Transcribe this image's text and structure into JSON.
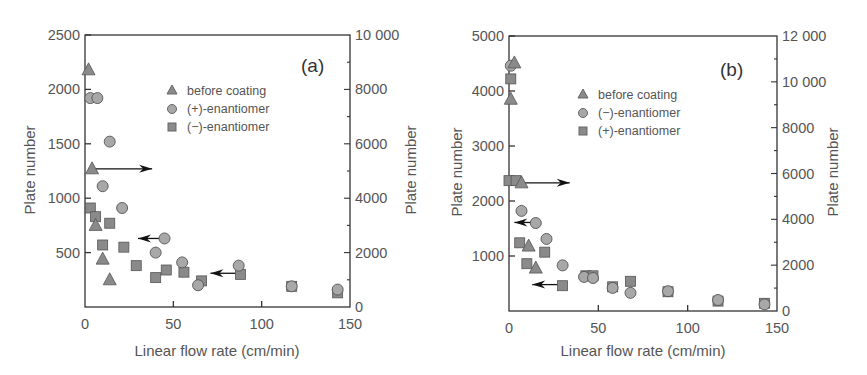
{
  "chart_data": [
    {
      "type": "scatter",
      "panel_label": "(a)",
      "title": "",
      "xlabel": "Linear flow rate (cm/min)",
      "ylabel": "Plate number",
      "ylabel_right": "Plate number",
      "xlim": [
        0,
        150
      ],
      "ylim": [
        0,
        2500
      ],
      "ylim_right": [
        0,
        10000
      ],
      "xticks": [
        0,
        50,
        100,
        150
      ],
      "yticks": [
        500,
        1000,
        1500,
        2000,
        2500
      ],
      "yticks_right": [
        0,
        2000,
        4000,
        6000,
        8000,
        10000
      ],
      "xtick_labels": [
        "0",
        "50",
        "100",
        "150"
      ],
      "ytick_labels": [
        "500",
        "1000",
        "1500",
        "2000",
        "2500"
      ],
      "ytick_right_labels": [
        "0",
        "2000",
        "4000",
        "6000",
        "8000",
        "10 000"
      ],
      "grid": false,
      "legend_position": "upper center",
      "series": [
        {
          "name": "before coating",
          "marker": "triangle",
          "axis": "right (arrow)",
          "x": [
            2,
            4,
            6,
            10,
            14
          ],
          "y": [
            2180,
            1270,
            750,
            440,
            250
          ]
        },
        {
          "name": "(+)-enantiomer",
          "marker": "circle",
          "axis": "left (arrow)",
          "x": [
            3,
            7,
            14,
            10,
            21,
            45,
            40,
            55,
            64,
            87,
            117,
            143
          ],
          "y": [
            1920,
            1920,
            1520,
            1110,
            910,
            630,
            500,
            410,
            200,
            380,
            190,
            160
          ]
        },
        {
          "name": "(−)-enantiomer",
          "marker": "square",
          "axis": "left (arrow)",
          "x": [
            3,
            6,
            14,
            10,
            22,
            29,
            40,
            46,
            56,
            66,
            88,
            117,
            143
          ],
          "y": [
            910,
            830,
            770,
            570,
            550,
            380,
            270,
            340,
            320,
            240,
            300,
            190,
            130
          ]
        }
      ],
      "annotations": [
        {
          "type": "arrow",
          "direction": "right",
          "from": [
            5,
            1270
          ],
          "to": [
            38,
            1270
          ]
        },
        {
          "type": "arrow",
          "direction": "left",
          "from": [
            44,
            630
          ],
          "to": [
            30,
            630
          ]
        },
        {
          "type": "arrow",
          "direction": "left",
          "from": [
            86,
            310
          ],
          "to": [
            71,
            310
          ]
        }
      ]
    },
    {
      "type": "scatter",
      "panel_label": "(b)",
      "title": "",
      "xlabel": "Linear flow rate (cm/min)",
      "ylabel": "Plate number",
      "ylabel_right": "Plate number",
      "xlim": [
        0,
        150
      ],
      "ylim": [
        0,
        5000
      ],
      "ylim_right": [
        0,
        12000
      ],
      "xticks": [
        0,
        50,
        100,
        150
      ],
      "yticks": [
        1000,
        2000,
        3000,
        4000,
        5000
      ],
      "yticks_right": [
        0,
        2000,
        4000,
        6000,
        8000,
        10000,
        12000
      ],
      "xtick_labels": [
        "0",
        "50",
        "100",
        "150"
      ],
      "ytick_labels": [
        "1000",
        "2000",
        "3000",
        "4000",
        "5000"
      ],
      "ytick_right_labels": [
        "0",
        "2000",
        "4000",
        "6000",
        "8000",
        "10 000",
        "12 000"
      ],
      "grid": false,
      "legend_position": "upper center",
      "series": [
        {
          "name": "before coating",
          "marker": "triangle",
          "axis": "right (arrow)",
          "x": [
            3,
            1,
            7,
            11,
            15
          ],
          "y": [
            4510,
            3850,
            2330,
            1180,
            780
          ]
        },
        {
          "name": "(−)-enantiomer",
          "marker": "circle",
          "axis": "left (arrow)",
          "x": [
            1,
            7,
            15,
            21,
            30,
            42,
            47,
            58,
            68,
            89,
            117,
            143
          ],
          "y": [
            4460,
            1820,
            1600,
            1310,
            830,
            620,
            600,
            420,
            330,
            360,
            200,
            120
          ]
        },
        {
          "name": "(+)-enantiomer",
          "marker": "square",
          "axis": "left (arrow)",
          "x": [
            1,
            0,
            4,
            6,
            10,
            20,
            30,
            43,
            47,
            58,
            68,
            89,
            117,
            143
          ],
          "y": [
            4220,
            2370,
            2370,
            1240,
            860,
            1070,
            460,
            640,
            640,
            440,
            540,
            350,
            180,
            140
          ]
        }
      ],
      "annotations": [
        {
          "type": "arrow",
          "direction": "right",
          "from": [
            6,
            2330
          ],
          "to": [
            34,
            2330
          ]
        },
        {
          "type": "arrow",
          "direction": "left",
          "from": [
            13,
            1610
          ],
          "to": [
            3,
            1610
          ]
        },
        {
          "type": "arrow",
          "direction": "left",
          "from": [
            28,
            480
          ],
          "to": [
            13,
            480
          ]
        }
      ]
    }
  ],
  "panels": [
    {
      "label": "(a)",
      "xlabel": "Linear flow rate (cm/min)",
      "ylabel_left": "Plate number",
      "ylabel_right": "Plate number",
      "legend": [
        "before coating",
        "(+)-enantiomer",
        "(−)-enantiomer"
      ]
    },
    {
      "label": "(b)",
      "xlabel": "Linear flow rate (cm/min)",
      "ylabel_left": "Plate number",
      "ylabel_right": "Plate number",
      "legend": [
        "before coating",
        "(−)-enantiomer",
        "(+)-enantiomer"
      ]
    }
  ],
  "colors": {
    "marker_fill": "#8a8a8a",
    "circle_fill": "#a8a8a8",
    "marker_stroke": "#555555",
    "axis": "#333333",
    "text": "#555555"
  }
}
